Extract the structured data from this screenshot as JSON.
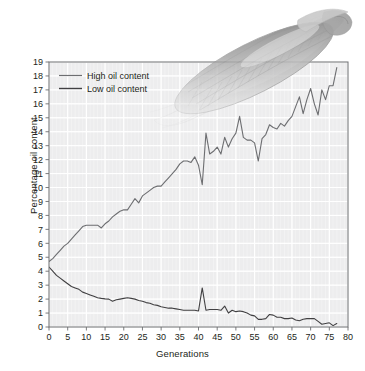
{
  "chart_data": {
    "type": "line",
    "title": "",
    "xlabel": "Generations",
    "ylabel": "Percentage oil content",
    "xlim": [
      0,
      80
    ],
    "ylim": [
      0,
      19
    ],
    "xticks": [
      "0",
      "5",
      "10",
      "15",
      "20",
      "25",
      "30",
      "35",
      "40",
      "45",
      "50",
      "55",
      "60",
      "65",
      "70",
      "75",
      "80"
    ],
    "yticks": [
      "0",
      "1",
      "2",
      "3",
      "4",
      "5",
      "6",
      "7",
      "8",
      "9",
      "10",
      "11",
      "12",
      "13",
      "14",
      "15",
      "16",
      "17",
      "18",
      "19"
    ],
    "grid": "major and minor gridlines, white lines on light grey panel",
    "legend_position": "upper left inside axes",
    "series": [
      {
        "name": "High oil content",
        "color": "#6d6e71",
        "x": [
          0,
          1,
          2,
          3,
          4,
          5,
          6,
          7,
          8,
          9,
          10,
          11,
          12,
          13,
          14,
          15,
          16,
          17,
          18,
          19,
          20,
          21,
          22,
          23,
          24,
          25,
          26,
          27,
          28,
          29,
          30,
          31,
          32,
          33,
          34,
          35,
          36,
          37,
          38,
          39,
          40,
          41,
          42,
          43,
          44,
          45,
          46,
          47,
          48,
          49,
          50,
          51,
          52,
          53,
          54,
          55,
          56,
          57,
          58,
          59,
          60,
          61,
          62,
          63,
          64,
          65,
          66,
          67,
          68,
          69,
          70,
          71,
          72,
          73,
          74,
          75,
          76,
          77
        ],
        "values": [
          4.7,
          4.9,
          5.2,
          5.5,
          5.8,
          6.0,
          6.3,
          6.6,
          6.9,
          7.2,
          7.3,
          7.3,
          7.3,
          7.3,
          7.1,
          7.4,
          7.6,
          7.9,
          8.1,
          8.3,
          8.4,
          8.4,
          8.8,
          9.2,
          8.9,
          9.4,
          9.6,
          9.8,
          10.0,
          10.1,
          10.1,
          10.4,
          10.7,
          11.0,
          11.3,
          11.7,
          11.9,
          11.9,
          11.8,
          12.2,
          11.6,
          10.2,
          13.9,
          12.4,
          12.6,
          12.9,
          12.4,
          13.6,
          12.9,
          13.5,
          13.9,
          15.1,
          13.6,
          13.4,
          13.4,
          13.2,
          11.9,
          13.5,
          13.8,
          14.5,
          14.3,
          14.2,
          14.6,
          14.4,
          14.8,
          15.1,
          15.8,
          16.5,
          15.3,
          16.3,
          17.1,
          16.0,
          15.2,
          17.0,
          16.3,
          17.3,
          17.3,
          18.6
        ],
        "notes": "Rises steadily from ~4.7% to ~18.6% over 77 generations; plateau near 7.3% at generations 10-14; sharp dip to ~10.2% at generation 41 followed by a jump to ~13.9%"
      },
      {
        "name": "Low oil content",
        "color": "#414042",
        "x": [
          0,
          1,
          2,
          3,
          4,
          5,
          6,
          7,
          8,
          9,
          10,
          11,
          12,
          13,
          14,
          15,
          16,
          17,
          18,
          19,
          20,
          21,
          22,
          23,
          24,
          25,
          26,
          27,
          28,
          29,
          30,
          31,
          32,
          33,
          34,
          35,
          36,
          37,
          38,
          39,
          40,
          41,
          42,
          43,
          44,
          45,
          46,
          47,
          48,
          49,
          50,
          51,
          52,
          53,
          54,
          55,
          56,
          57,
          58,
          59,
          60,
          61,
          62,
          63,
          64,
          65,
          66,
          67,
          68,
          69,
          70,
          71,
          72,
          73,
          74,
          75,
          76,
          77
        ],
        "values": [
          4.3,
          4.0,
          3.7,
          3.5,
          3.3,
          3.1,
          2.9,
          2.8,
          2.7,
          2.5,
          2.4,
          2.3,
          2.2,
          2.1,
          2.05,
          2.02,
          2.0,
          1.85,
          1.95,
          2.0,
          2.05,
          2.1,
          2.05,
          2.0,
          1.9,
          1.85,
          1.75,
          1.7,
          1.6,
          1.55,
          1.45,
          1.4,
          1.35,
          1.35,
          1.3,
          1.25,
          1.2,
          1.2,
          1.2,
          1.2,
          1.15,
          2.8,
          1.2,
          1.25,
          1.25,
          1.25,
          1.2,
          1.5,
          1.0,
          1.2,
          1.1,
          1.15,
          1.1,
          1.0,
          0.85,
          0.8,
          0.55,
          0.55,
          0.6,
          0.9,
          0.85,
          0.7,
          0.7,
          0.6,
          0.6,
          0.65,
          0.5,
          0.45,
          0.55,
          0.6,
          0.6,
          0.6,
          0.4,
          0.2,
          0.25,
          0.3,
          0.1,
          0.25
        ],
        "notes": "Declines from ~4.3% toward ~0.2%; single spike to ~2.8% at generation 41"
      }
    ],
    "annotations": [
      {
        "name": "corn-cob-photo",
        "description": "grayscale photograph of an ear of corn (maize cob) partially husked, rotated diagonally, semi-transparent, overlapping the upper-right of the plot"
      }
    ]
  },
  "legend": {
    "items": [
      {
        "label": "High oil content",
        "color": "#6d6e71"
      },
      {
        "label": "Low oil content",
        "color": "#414042"
      }
    ]
  },
  "colors": {
    "panel": "#eeeeee",
    "gridline": "#ffffff",
    "frame": "#58595b",
    "text": "#231f20",
    "high_series": "#6d6e71",
    "low_series": "#414042"
  }
}
